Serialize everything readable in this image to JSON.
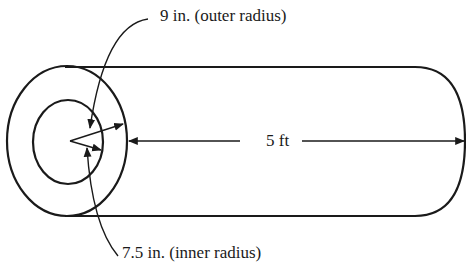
{
  "diagram": {
    "type": "cylindrical pipe (hollow cylinder)",
    "labels": {
      "outer_radius": "9 in. (outer radius)",
      "inner_radius": "7.5 in. (inner radius)",
      "length": "5 ft"
    },
    "dimensions": {
      "outer_radius_in": 9,
      "inner_radius_in": 7.5,
      "length_ft": 5
    },
    "colors": {
      "stroke": "#1a1a1a",
      "background": "#ffffff"
    }
  }
}
